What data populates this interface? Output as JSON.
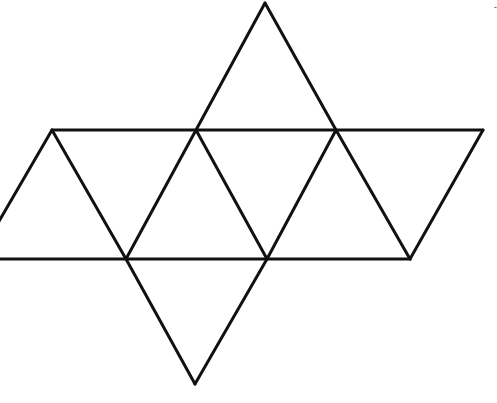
{
  "diagram": {
    "style": {
      "background": "#ffffff",
      "stroke": "#111111",
      "stroke_width": 3
    },
    "vertices": {
      "top_apex": [
        265,
        3
      ],
      "upper_left": [
        52,
        130
      ],
      "upper_mid_left": [
        196,
        130
      ],
      "upper_mid_right": [
        336,
        130
      ],
      "upper_right": [
        483,
        130
      ],
      "lower_far_left": [
        -23,
        259
      ],
      "lower_left_edge": [
        0,
        259
      ],
      "lower_mid_left": [
        126,
        259
      ],
      "lower_mid_right": [
        267,
        259
      ],
      "lower_right": [
        410,
        259
      ],
      "bottom_apex": [
        195,
        384
      ]
    },
    "edges": [
      {
        "name": "upper-horizontal",
        "from": [
          52,
          130
        ],
        "to": [
          483,
          130
        ]
      },
      {
        "name": "lower-horizontal",
        "from": [
          0,
          259
        ],
        "to": [
          410,
          259
        ]
      },
      {
        "name": "top-apex-left",
        "from": [
          265,
          3
        ],
        "to": [
          196,
          130
        ]
      },
      {
        "name": "top-apex-right",
        "from": [
          265,
          3
        ],
        "to": [
          336,
          130
        ]
      },
      {
        "name": "left-tri-left",
        "from": [
          52,
          130
        ],
        "to": [
          -23,
          259
        ]
      },
      {
        "name": "left-tri-right",
        "from": [
          52,
          130
        ],
        "to": [
          126,
          259
        ]
      },
      {
        "name": "mid1-left",
        "from": [
          196,
          130
        ],
        "to": [
          126,
          259
        ]
      },
      {
        "name": "mid1-right",
        "from": [
          196,
          130
        ],
        "to": [
          267,
          259
        ]
      },
      {
        "name": "mid2-left",
        "from": [
          336,
          130
        ],
        "to": [
          267,
          259
        ]
      },
      {
        "name": "mid2-right",
        "from": [
          336,
          130
        ],
        "to": [
          410,
          259
        ]
      },
      {
        "name": "right-tri",
        "from": [
          483,
          130
        ],
        "to": [
          410,
          259
        ]
      },
      {
        "name": "bottom-apex-left",
        "from": [
          126,
          259
        ],
        "to": [
          195,
          384
        ]
      },
      {
        "name": "bottom-apex-right",
        "from": [
          267,
          259
        ],
        "to": [
          195,
          384
        ]
      }
    ],
    "faces": 8,
    "mark": {
      "position": [
        494,
        10
      ],
      "text": "-"
    }
  }
}
